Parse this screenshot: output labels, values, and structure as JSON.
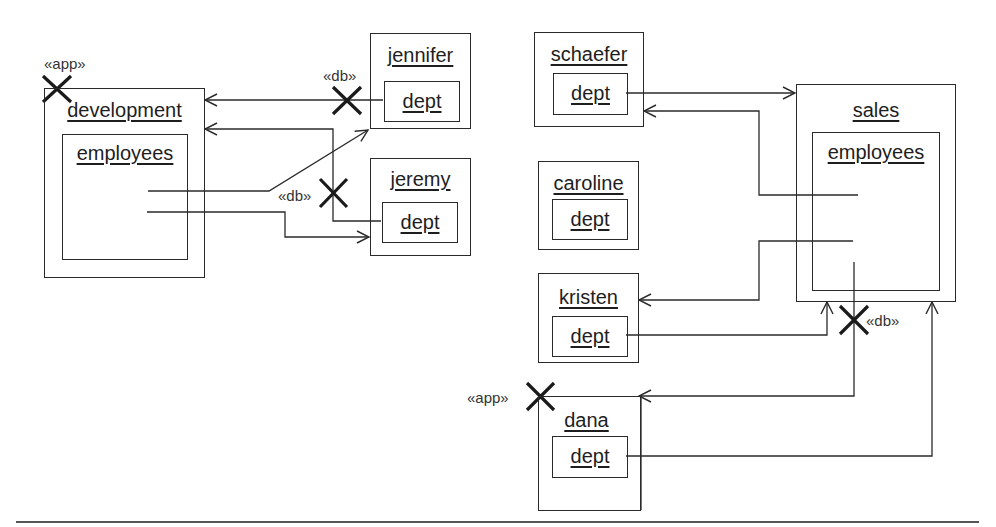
{
  "diagram": {
    "type": "UML object/deployment diagram",
    "objects": [
      {
        "id": "development",
        "label": "development",
        "inner": {
          "label": "employees"
        },
        "stereotype": "«app»",
        "destroyed": true
      },
      {
        "id": "jennifer",
        "label": "jennifer",
        "inner": {
          "label": "dept"
        }
      },
      {
        "id": "jeremy",
        "label": "jeremy",
        "inner": {
          "label": "dept"
        }
      },
      {
        "id": "schaefer",
        "label": "schaefer",
        "inner": {
          "label": "dept"
        }
      },
      {
        "id": "caroline",
        "label": "caroline",
        "inner": {
          "label": "dept"
        }
      },
      {
        "id": "kristen",
        "label": "kristen",
        "inner": {
          "label": "dept"
        }
      },
      {
        "id": "dana",
        "label": "dana",
        "inner": {
          "label": "dept"
        },
        "stereotype": "«app»",
        "destroyed": true
      },
      {
        "id": "sales",
        "label": "sales",
        "inner": {
          "label": "employees"
        }
      }
    ],
    "stereotypes": {
      "app_development": "«app»",
      "db_jennifer": "«db»",
      "db_jeremy": "«db»",
      "db_sales": "«db»",
      "app_dana": "«app»"
    },
    "connections": [
      {
        "from": "jennifer.dept",
        "to": "development",
        "marker": "«db» destroyed"
      },
      {
        "from": "jeremy.dept",
        "to": "development",
        "marker": "«db» destroyed"
      },
      {
        "from": "development.employees",
        "to": "jennifer"
      },
      {
        "from": "development.employees",
        "to": "jeremy"
      },
      {
        "from": "schaefer.dept",
        "to": "sales"
      },
      {
        "from": "sales.employees",
        "to": "schaefer"
      },
      {
        "from": "sales.employees",
        "to": "kristen"
      },
      {
        "from": "kristen.dept",
        "to": "sales"
      },
      {
        "from": "sales.employees",
        "to": "dana",
        "marker": "«db» destroyed"
      },
      {
        "from": "dana.dept",
        "to": "sales"
      }
    ],
    "colors": {
      "line": "#2a2a2a",
      "background": "#ffffff"
    }
  }
}
